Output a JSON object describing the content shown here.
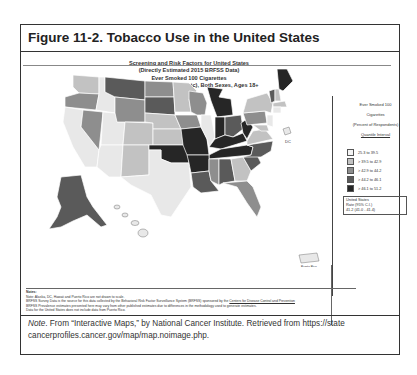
{
  "figure": {
    "title": "Figure 11-2. Tobacco Use in the United States"
  },
  "map": {
    "subtitle_lines": [
      "Screening and Risk Factors for United States",
      "(Directly Estimated 2015 BRFSS Data)",
      "Ever Smoked 100 Cigarettes",
      "All Races (includes Hispanic), Both Sexes, Ages 18+"
    ],
    "labels": {
      "dc": "DC",
      "puerto_rico": "Puerto Rico"
    },
    "colors": {
      "q1": "#e8e8e8",
      "q2": "#c2c2c2",
      "q3": "#8e8e8e",
      "q4": "#5a5a5a",
      "q5": "#262626"
    }
  },
  "legend": {
    "header_lines": [
      "Ever Smoked 100",
      "Cigarettes",
      "(Percent of Respondents)"
    ],
    "interval_link": "Quantile Interval",
    "items": [
      {
        "label": "25.3 to 39.5"
      },
      {
        "label": "> 39.5 to 42.9"
      },
      {
        "label": "> 42.9 to 44.2"
      },
      {
        "label": "> 44.2 to 46.1"
      },
      {
        "label": "> 46.1 to 51.2"
      }
    ],
    "us_rate": {
      "line1": "United States",
      "line2": "Rate (95% C.I.)",
      "line3": "41.2 (41.0 - 41.4)"
    }
  },
  "notes": {
    "heading": "Notes:",
    "line1": "Note: Alaska, DC, Hawaii and Puerto Rico are not drawn to scale.",
    "line2a": "BRFSS Survey Data is the source for this data collected by the Behavioral Risk Factor Surveillance System (BRFSS) sponsored by the ",
    "line2_link": "Centers for Disease Control and Prevention",
    "line3": "BRFSS Prevalence estimates presented here may vary from other published estimates due to differences in the methodology used to generate estimates.",
    "line4": "Data for the United States does not include data from Puerto Rico."
  },
  "footer_note": {
    "label": "Note",
    "text": ". From “Interactive Maps,” by National Cancer Institute. Retrieved from https://state cancerprofiles.cancer.gov/map/map.noimage.php."
  }
}
